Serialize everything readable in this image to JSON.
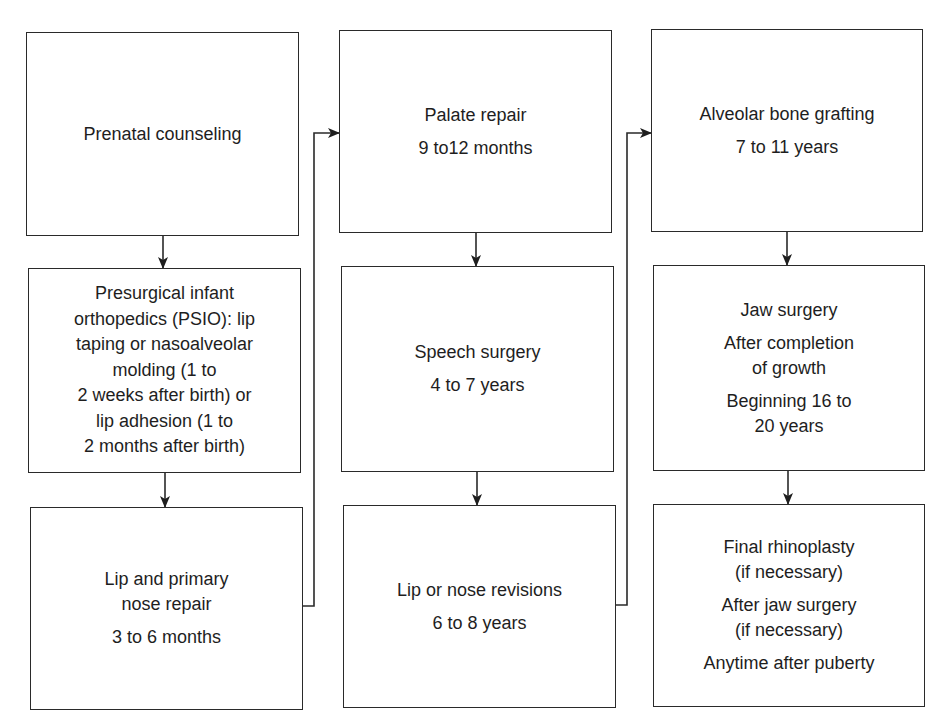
{
  "diagram": {
    "type": "flowchart",
    "columns": [
      {
        "boxes": [
          {
            "id": "prenatal",
            "paragraphs": [
              "Prenatal counseling"
            ]
          },
          {
            "id": "psio",
            "paragraphs": [
              "Presurgical infant\northopedics (PSIO): lip\ntaping or nasoalveolar\nmolding (1 to\n2 weeks after birth) or\nlip adhesion (1 to\n2 months after birth)"
            ]
          },
          {
            "id": "lip-nose-repair",
            "paragraphs": [
              "Lip and primary\nnose repair",
              "3 to 6 months"
            ]
          }
        ]
      },
      {
        "boxes": [
          {
            "id": "palate-repair",
            "paragraphs": [
              "Palate repair",
              "9 to12 months"
            ]
          },
          {
            "id": "speech-surgery",
            "paragraphs": [
              "Speech surgery",
              "4 to 7 years"
            ]
          },
          {
            "id": "lip-nose-revisions",
            "paragraphs": [
              "Lip or nose revisions",
              "6 to 8 years"
            ]
          }
        ]
      },
      {
        "boxes": [
          {
            "id": "alveolar-grafting",
            "paragraphs": [
              "Alveolar bone grafting",
              "7 to 11 years"
            ]
          },
          {
            "id": "jaw-surgery",
            "paragraphs": [
              "Jaw surgery",
              "After completion\nof growth",
              "Beginning 16 to\n20 years"
            ]
          },
          {
            "id": "final-rhinoplasty",
            "paragraphs": [
              "Final rhinoplasty\n(if necessary)",
              "After jaw surgery\n(if necessary)",
              "Anytime after puberty"
            ]
          }
        ]
      }
    ],
    "edges": [
      [
        "prenatal",
        "psio"
      ],
      [
        "psio",
        "lip-nose-repair"
      ],
      [
        "lip-nose-repair",
        "palate-repair"
      ],
      [
        "palate-repair",
        "speech-surgery"
      ],
      [
        "speech-surgery",
        "lip-nose-revisions"
      ],
      [
        "lip-nose-revisions",
        "alveolar-grafting"
      ],
      [
        "alveolar-grafting",
        "jaw-surgery"
      ],
      [
        "jaw-surgery",
        "final-rhinoplasty"
      ]
    ],
    "colors": {
      "line": "#2a2a2a",
      "text": "#1e1e1e",
      "background": "#ffffff"
    }
  }
}
